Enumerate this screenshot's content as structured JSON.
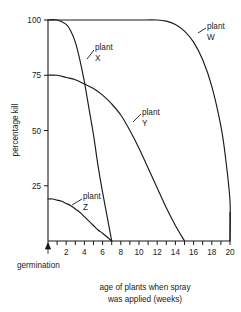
{
  "chart_data": {
    "type": "line",
    "title": "",
    "xlabel": "age of plants when spray was applied (weeks)",
    "ylabel": "percentage kill",
    "xlim": [
      0,
      20
    ],
    "ylim": [
      0,
      100
    ],
    "grid": false,
    "legend_position": "inline-labels",
    "x_ticks_major": [
      2,
      4,
      6,
      8,
      10,
      12,
      14,
      16,
      18,
      20
    ],
    "x_ticks_minor_step": 1,
    "y_ticks": [
      25,
      50,
      75,
      100
    ],
    "annotations": [
      {
        "text": "germination",
        "x": 0,
        "note": "arrow marks germination at week 0"
      }
    ],
    "series": [
      {
        "name": "plant W",
        "label_line1": "plant",
        "label_line2": "W",
        "x": [
          0,
          2,
          4,
          6,
          8,
          10,
          12,
          13,
          14,
          15,
          16,
          17,
          18,
          19,
          19.5,
          20,
          20
        ],
        "values": [
          100,
          100,
          100,
          100,
          100,
          100,
          100,
          99.5,
          98,
          95,
          90,
          82,
          70,
          52,
          38,
          18,
          0
        ]
      },
      {
        "name": "plant X",
        "label_line1": "plant",
        "label_line2": "X",
        "x": [
          0,
          1,
          2,
          2.5,
          3,
          3.5,
          4,
          4.5,
          5,
          5.5,
          6,
          6.5,
          7
        ],
        "values": [
          100,
          100,
          98,
          95,
          90,
          82,
          72,
          60,
          48,
          34,
          22,
          11,
          0
        ]
      },
      {
        "name": "plant Y",
        "label_line1": "plant",
        "label_line2": "Y",
        "x": [
          0,
          1,
          2,
          3,
          4,
          5,
          6,
          7,
          8,
          9,
          10,
          11,
          12,
          13,
          14,
          15
        ],
        "values": [
          75,
          75,
          74,
          73,
          71,
          69,
          66,
          62,
          57,
          50,
          42,
          33,
          24,
          15,
          7,
          0
        ]
      },
      {
        "name": "plant Z",
        "label_line1": "plant",
        "label_line2": "Z",
        "x": [
          0,
          0.5,
          1,
          1.5,
          2,
          2.5,
          3,
          3.5,
          4,
          4.5,
          5,
          5.5,
          6,
          6.5,
          7
        ],
        "values": [
          19,
          19,
          18.5,
          18,
          17,
          16,
          14.5,
          13,
          11,
          9,
          7,
          5,
          3.5,
          1.8,
          0
        ]
      }
    ]
  },
  "axis": {
    "y_labels": [
      "100",
      "75",
      "50",
      "25"
    ],
    "x_labels": [
      "2",
      "4",
      "6",
      "8",
      "10",
      "12",
      "14",
      "16",
      "18",
      "20"
    ],
    "y_title": "percentage kill",
    "x_title_line1": "age of plants when spray",
    "x_title_line2": "was applied (weeks)",
    "germination_label": "germination"
  },
  "labels": {
    "w_line1": "plant",
    "w_line2": "W",
    "x_line1": "plant",
    "x_line2": "X",
    "y_line1": "plant",
    "y_line2": "Y",
    "z_line1": "plant",
    "z_line2": "Z"
  },
  "colors": {
    "ink": "#1a1a1a",
    "background": "#ffffff"
  }
}
